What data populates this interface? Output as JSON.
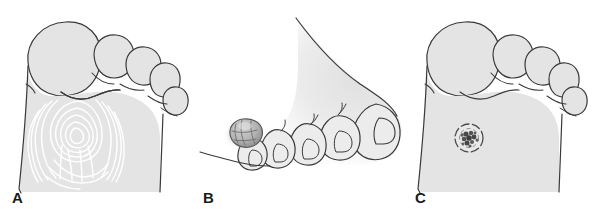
{
  "figure": {
    "background_color": "#ffffff",
    "width": 596,
    "height": 209
  },
  "style": {
    "skin_fill": "#e4e4e4",
    "skin_fill_light": "#ececec",
    "outline_color": "#3a3a3a",
    "outline_width": "1.2",
    "skin_line_color": "#ffffff",
    "lesion_fill": "#b8b8b8",
    "lesion_dark": "#4a4a4a",
    "label_color": "#1a1a1a",
    "shadow_color": "#9a9a9a"
  },
  "panels": [
    {
      "id": "a",
      "label": "A",
      "view": "plantar",
      "description": "Plantar surface of forefoot with callus showing preserved concentric skin lines",
      "lesion": {
        "name": "callus",
        "feature": "skin-lines-preserved",
        "center_x": 78,
        "center_y": 133
      }
    },
    {
      "id": "b",
      "label": "B",
      "view": "dorsomedial",
      "description": "Dorsomedial view of toes with raised lobulated nodule on medial great toe",
      "lesion": {
        "name": "raised-nodule",
        "feature": "elevated-lobulated",
        "center_x": 53,
        "center_y": 133
      }
    },
    {
      "id": "c",
      "label": "C",
      "view": "plantar",
      "description": "Plantar surface of forefoot with wart showing interrupted skin lines and thrombosed capillaries",
      "lesion": {
        "name": "plantar-wart",
        "feature": "thrombosed-capillaries",
        "center_x": 74,
        "center_y": 138
      }
    }
  ]
}
